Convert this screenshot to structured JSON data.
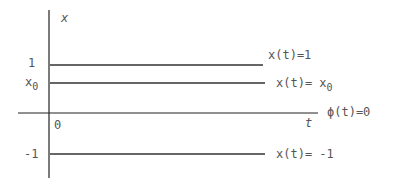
{
  "diagram": {
    "axes": {
      "y_label": "x",
      "x_label": "t",
      "origin_label": "0"
    },
    "ticks": {
      "one": "1",
      "x0": "x",
      "x0_sub": "0",
      "minus_one": "-1"
    },
    "lines": [
      {
        "name": "x=1",
        "label": "x(t)=1"
      },
      {
        "name": "x=x0",
        "label": "x(t)= x",
        "sub": "0"
      },
      {
        "name": "phi=0",
        "label": "ϕ(t)=0"
      },
      {
        "name": "x=-1",
        "label": "x(t)= -1"
      }
    ],
    "colors": {
      "line": "#333333",
      "text": "#555555"
    }
  }
}
